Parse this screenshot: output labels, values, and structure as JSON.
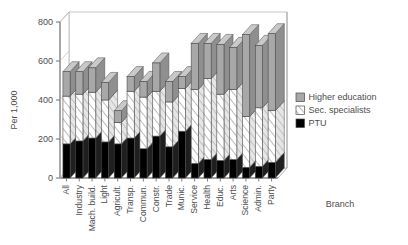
{
  "chart_data": {
    "type": "bar",
    "subtype": "stacked-3d-column",
    "title": "",
    "xlabel": "Branch",
    "ylabel": "Per 1,000",
    "ylim": [
      0,
      800
    ],
    "yticks": [
      0,
      200,
      400,
      600,
      800
    ],
    "grid": false,
    "legend_position": "right",
    "categories": [
      "All",
      "Industry",
      "Mach. build.",
      "Light",
      "Agricult.",
      "Transp.",
      "Commun.",
      "Constr.",
      "Trade",
      "Munic.",
      "Service",
      "Health",
      "Educ.",
      "Arts",
      "Science",
      "Admin.",
      "Party"
    ],
    "series": [
      {
        "name": "PTU",
        "color": "#000000",
        "values": [
          175,
          190,
          205,
          185,
          175,
          205,
          150,
          215,
          160,
          240,
          75,
          95,
          90,
          95,
          55,
          60,
          80
        ]
      },
      {
        "name": "Sec. specialists",
        "color": "#ffffff",
        "values": [
          245,
          240,
          235,
          215,
          110,
          240,
          265,
          230,
          230,
          220,
          380,
          415,
          340,
          360,
          260,
          300,
          265
        ]
      },
      {
        "name": "Higher education",
        "color": "#a8a8a8",
        "values": [
          125,
          115,
          125,
          90,
          60,
          75,
          80,
          145,
          105,
          60,
          235,
          180,
          255,
          215,
          420,
          320,
          395
        ]
      }
    ],
    "totals": [
      545,
      545,
      565,
      490,
      345,
      520,
      495,
      590,
      495,
      520,
      690,
      690,
      685,
      670,
      735,
      680,
      740
    ]
  },
  "legend": {
    "items": [
      {
        "label": "Higher education",
        "swatch": "gray-solid"
      },
      {
        "label": "Sec. specialists",
        "swatch": "white-hatched"
      },
      {
        "label": "PTU",
        "swatch": "black-solid"
      }
    ]
  },
  "axes": {
    "y_title": "Per 1,000",
    "x_title": "Branch"
  }
}
